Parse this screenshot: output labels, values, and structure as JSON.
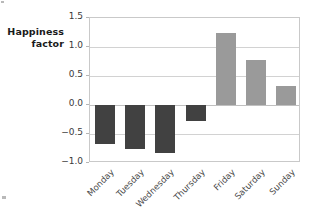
{
  "chart_data": {
    "type": "bar",
    "title": "",
    "subtitle": "",
    "xlabel": "",
    "ylabel": "Happiness factor",
    "ylabel_lines": [
      "Happiness",
      "factor"
    ],
    "categories": [
      "Monday",
      "Tuesday",
      "Wednesday",
      "Thursday",
      "Friday",
      "Saturday",
      "Sunday"
    ],
    "values": [
      -0.68,
      -0.76,
      -0.83,
      -0.28,
      1.24,
      0.78,
      0.33
    ],
    "ylim": [
      -1.0,
      1.5
    ],
    "yticks": [
      1.5,
      1.0,
      0.5,
      0.0,
      -0.5,
      -1.0
    ],
    "ytick_labels": [
      "1.5",
      "1.0",
      "0.5",
      "0.0",
      "-0.5",
      "-1.0"
    ],
    "grid": true,
    "legend": "none",
    "bar_colors": {
      "negative": "#414141",
      "positive": "#9a9a9a"
    },
    "axis_color": "#c9c9c9",
    "gridline_color": "#d2d2d2",
    "zero_line": 0.0
  }
}
